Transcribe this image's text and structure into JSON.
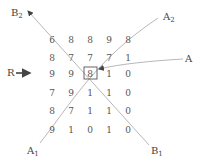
{
  "diagram": {
    "grid": [
      [
        "6",
        "8",
        "8",
        "9",
        "8"
      ],
      [
        "8",
        "7",
        "7",
        "7",
        "1"
      ],
      [
        "9",
        "9",
        "8",
        "1",
        "0"
      ],
      [
        "7",
        "9",
        "1",
        "1",
        "0"
      ],
      [
        "8",
        "7",
        "1",
        "1",
        "0"
      ],
      [
        "9",
        "1",
        "0",
        "1",
        "0"
      ]
    ],
    "highlighted_cell": {
      "row": 2,
      "col": 2
    },
    "labels": {
      "B2": {
        "base": "B",
        "sub": "2"
      },
      "A2": {
        "base": "A",
        "sub": "2"
      },
      "A": {
        "base": "A",
        "sub": ""
      },
      "R": {
        "base": "R",
        "sub": ""
      },
      "A1": {
        "base": "A",
        "sub": "1"
      },
      "B1": {
        "base": "B",
        "sub": "1"
      }
    },
    "colors": {
      "line": "#b0b0b0",
      "arrow": "#555555",
      "text": "#555555"
    }
  }
}
